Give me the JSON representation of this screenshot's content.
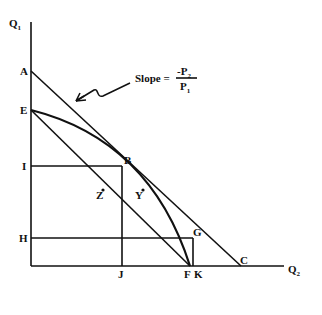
{
  "diagram": {
    "type": "production possibility frontier",
    "axes": {
      "y_axis": {
        "label": "Q",
        "subscript": "1"
      },
      "x_axis": {
        "label": "Q",
        "subscript": "2"
      }
    },
    "slope_annotation": {
      "prefix": "Slope =",
      "numerator": "-P",
      "numerator_sub": "2",
      "denominator": "P",
      "denominator_sub": "1"
    },
    "points": {
      "A": "A",
      "E": "E",
      "I": "I",
      "H": "H",
      "B": "B",
      "G": "G",
      "C": "C",
      "F": "F",
      "K": "K",
      "J": "J",
      "Z": "Z",
      "Y": "Y"
    }
  }
}
